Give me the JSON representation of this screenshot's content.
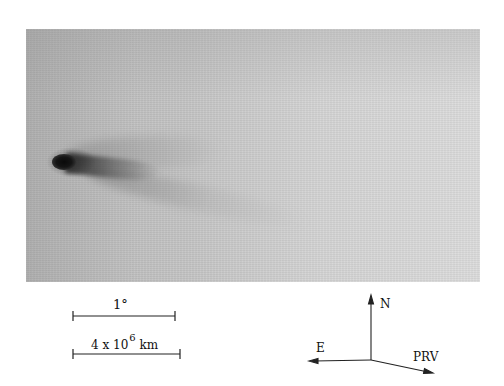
{
  "figure": {
    "plate_colors": {
      "background_left": "#b9b9b9",
      "background_right": "#dcdcdc",
      "nucleus": "#0a0a0a"
    }
  },
  "scale_bars": {
    "angular": {
      "label": "1°"
    },
    "linear": {
      "label_prefix": "4 x 10",
      "label_exponent": "6",
      "label_unit": "km"
    }
  },
  "compass": {
    "north_label": "N",
    "east_label": "E",
    "prv_label": "PRV"
  }
}
